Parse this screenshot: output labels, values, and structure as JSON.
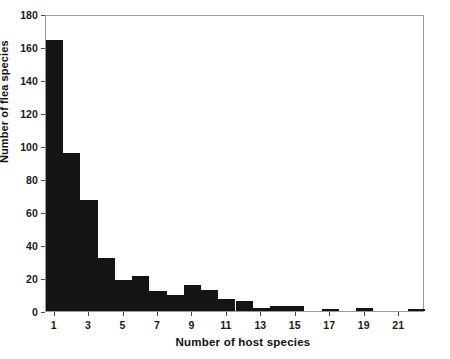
{
  "chart_data": {
    "type": "bar",
    "title": "",
    "xlabel": "Number of host species",
    "ylabel": "Number of flea species",
    "categories": [
      1,
      2,
      3,
      4,
      5,
      6,
      7,
      8,
      9,
      10,
      11,
      12,
      13,
      14,
      15,
      16,
      17,
      18,
      19,
      20,
      21,
      22
    ],
    "values": [
      164,
      96,
      67,
      32,
      19,
      21,
      12,
      10,
      16,
      13,
      7,
      6,
      2,
      3,
      3,
      0,
      1,
      0,
      2,
      0,
      0,
      1
    ],
    "xlim": [
      0.5,
      22.5
    ],
    "ylim": [
      0,
      180
    ],
    "xticks": [
      1,
      3,
      5,
      7,
      9,
      11,
      13,
      15,
      17,
      19,
      21
    ],
    "xtick_labels": [
      "1",
      "3",
      "5",
      "7",
      "9",
      "11",
      "13",
      "15",
      "17",
      "19",
      "21"
    ],
    "yticks": [
      0,
      20,
      40,
      60,
      80,
      100,
      120,
      140,
      160,
      180
    ],
    "ytick_labels": [
      "0",
      "20",
      "40",
      "60",
      "80",
      "100",
      "120",
      "140",
      "160",
      "180"
    ],
    "grid": false,
    "legend": null,
    "bar_color": "#141414",
    "frame_color": "#9a9a9a",
    "background": "#ffffff"
  }
}
